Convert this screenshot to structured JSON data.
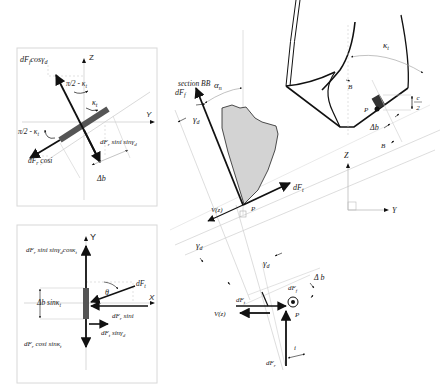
{
  "diagram": {
    "top_left_panel": {
      "axis_z": "Z",
      "axis_y": "Y",
      "label_dFf_cos": "dF",
      "label_dFf_cos_sub": "f",
      "label_dFf_cos_rest": "cosγ",
      "label_dFf_cos_sub2": "d",
      "label_pi2_kt_top": "π/2 - κ",
      "label_pi2_kt_top_sub": "t",
      "label_kt": "κ",
      "label_kt_sub": "t",
      "label_pi2_kt_left": "π/2 - κ",
      "label_pi2_kt_left_sub": "t",
      "label_dFr_cosi": "dF",
      "label_dFr_cosi_sub": "r",
      "label_dFr_cosi_rest": " cosi",
      "label_dFr_sini": "dF",
      "label_dFr_sini_sub": "r",
      "label_dFr_sini_rest": " sini sinγ",
      "label_dFr_sini_sub2": "d",
      "label_db": "Δb"
    },
    "bottom_left_panel": {
      "axis_y": "Y",
      "axis_x": "X",
      "label_top": "dF",
      "label_top_sub": "r",
      "label_top_rest": " sini sinγ",
      "label_top_sub2": "d",
      "label_top_rest2": "cosκ",
      "label_top_sub3": "t",
      "label_dFt": "dF",
      "label_dFt_sub": "t",
      "label_theta": "θ",
      "label_db_sin": "Δb sinκ",
      "label_db_sin_sub": "t",
      "label_dFr_sini": "dF",
      "label_dFr_sini_sub": "r",
      "label_dFr_sini_rest": " sini",
      "label_dFt_sin": "dF",
      "label_dFt_sin_sub": "t",
      "label_dFt_sin_rest": " sinγ",
      "label_dFt_sin_sub2": "d",
      "label_bottom": "dF",
      "label_bottom_sub": "r",
      "label_bottom_rest": " cosi sinκ",
      "label_bottom_sub2": "t"
    },
    "section_view": {
      "title": "section BB",
      "label_alpha": "α",
      "label_alpha_sub": "n",
      "label_dFf": "dF",
      "label_dFf_sub": "f",
      "label_gamma": "γ",
      "label_gamma_sub": "d",
      "label_dFt": "dF",
      "label_dFt_sub": "t",
      "label_vz": "V(z)",
      "label_p": "P",
      "label_gamma2": "γ",
      "label_gamma2_sub": "d"
    },
    "drill_view": {
      "label_kt": "κ",
      "label_kt_sub": "t",
      "label_B_top": "B",
      "label_B_bottom": "B",
      "label_p": "P",
      "label_c": "c",
      "label_c_den": "2",
      "label_db": "Δb",
      "axis_z": "Z",
      "axis_y": "Y"
    },
    "bottom_center_view": {
      "label_gamma": "γ",
      "label_gamma_sub": "d",
      "label_db": "Δ b",
      "label_dFf": "dF",
      "label_dFf_sub": "f",
      "label_dFt": "dF",
      "label_dFt_sub": "t",
      "label_vz": "V(z)",
      "label_p": "P",
      "label_i": "i",
      "label_dFr": "dF",
      "label_dFr_sub": "r"
    },
    "colors": {
      "stroke": "#111111",
      "thin": "#bdbdbd",
      "panel_border": "#d8d8d8",
      "chip_fill": "#d3d3d3",
      "edge_fill": "#555555"
    }
  }
}
